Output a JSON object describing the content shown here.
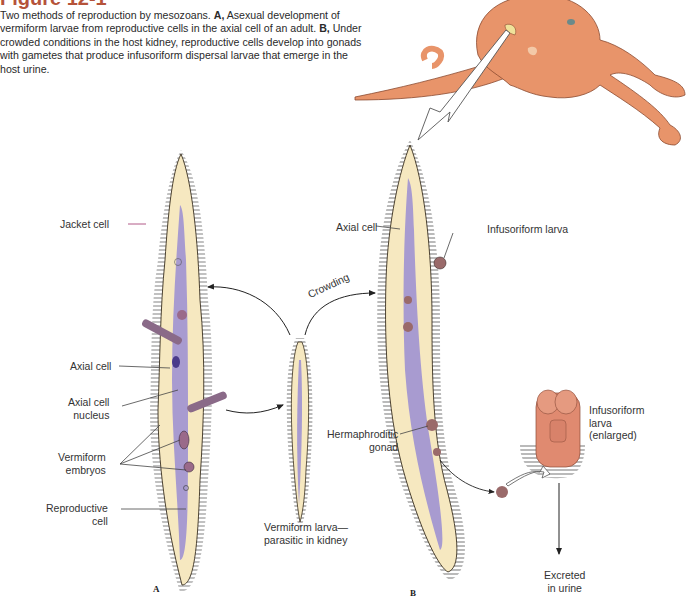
{
  "figure": {
    "title": "Figure 12-1",
    "caption": {
      "intro": "Two methods of reproduction by mesozoans.",
      "a_marker": "A,",
      "a_text": "Asexual development of vermiform larvae from reproductive cells in the axial cell of an adult.",
      "b_marker": "B,",
      "b_text": "Under crowded conditions in the host kidney, reproductive cells develop into gonads with gametes that produce infusoriform dispersal larvae that emerge in the host urine."
    }
  },
  "labels": {
    "jacket_cell": "Jacket cell",
    "axial_cell_a": "Axial cell",
    "axial_cell_nucleus_1": "Axial cell",
    "axial_cell_nucleus_2": "nucleus",
    "vermiform_embryos_1": "Vermiform",
    "vermiform_embryos_2": "embryos",
    "reproductive_cell_1": "Reproductive",
    "reproductive_cell_2": "cell",
    "vermiform_larva_1": "Vermiform larva—",
    "vermiform_larva_2": "parasitic in kidney",
    "crowding": "Crowding",
    "axial_cell_b": "Axial cell",
    "infusoriform_larva": "Infusoriform larva",
    "hermaphroditic_gonad_1": "Hermaphroditic",
    "hermaphroditic_gonad_2": "gonad",
    "infusoriform_enlarged_1": "Infusoriform",
    "infusoriform_enlarged_2": "larva",
    "infusoriform_enlarged_3": "(enlarged)",
    "excreted_1": "Excreted",
    "excreted_2": "in urine"
  },
  "panels": {
    "a": "A",
    "b": "B"
  },
  "colors": {
    "title": "#b5533a",
    "octopus": "#e8946a",
    "worm_body": "#f6e8c0",
    "axial_cell": "#a89bd0",
    "cilia": "#3a3a3a",
    "larva_enlarged": "#e08a70"
  }
}
